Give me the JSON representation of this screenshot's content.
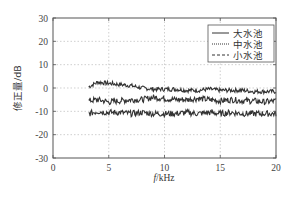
{
  "chart_data": {
    "type": "line",
    "title": "",
    "xlabel": "f/kHz",
    "ylabel": "修正量/dB",
    "xlim": [
      0,
      20
    ],
    "ylim": [
      -30,
      30
    ],
    "xticks": [
      0,
      5,
      10,
      15,
      20
    ],
    "yticks": [
      30,
      20,
      10,
      0,
      -10,
      -20,
      -30
    ],
    "grid": true,
    "legend_position": "upper right",
    "x": [
      3.2,
      4,
      5,
      6,
      7,
      8,
      9,
      10,
      11,
      12,
      13,
      14,
      15,
      16,
      17,
      18,
      19,
      20
    ],
    "series": [
      {
        "name": "大水池",
        "style": "solid",
        "values": [
          0.5,
          2.5,
          2,
          1.5,
          1,
          0,
          -0.5,
          -0.5,
          -0.5,
          -1,
          -1,
          -0.5,
          -1,
          -1,
          -1,
          -1.5,
          -1.5,
          -1.5
        ]
      },
      {
        "name": "中水池",
        "style": "dotted",
        "values": [
          -5.5,
          -5,
          -6,
          -5.5,
          -5,
          -5,
          -4,
          -4.5,
          -5,
          -5,
          -4.5,
          -5,
          -5.5,
          -5,
          -5.5,
          -5.5,
          -6,
          -5.5
        ]
      },
      {
        "name": "小水池",
        "style": "dashed",
        "values": [
          -11,
          -10,
          -10.5,
          -10.5,
          -11,
          -10.5,
          -11,
          -11,
          -11,
          -10.5,
          -11,
          -10.5,
          -11,
          -10.5,
          -11,
          -11,
          -11,
          -11
        ]
      }
    ]
  },
  "axes": {
    "xlabel_italic": "f",
    "xlabel_rest": "/kHz",
    "ylabel": "修正量/dB"
  },
  "legend": [
    {
      "label": "大水池"
    },
    {
      "label": "中水池"
    },
    {
      "label": "小水池"
    }
  ]
}
